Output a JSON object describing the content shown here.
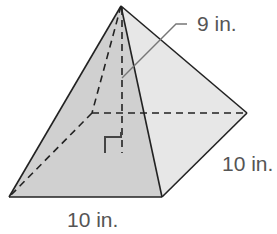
{
  "figure": {
    "type": "square pyramid",
    "labels": {
      "height": "9 in.",
      "base_front_edge": "10 in.",
      "base_side_edge": "10 in."
    },
    "colors": {
      "left_face": "#d9d9d9",
      "front_face": "#cfcfcf",
      "right_face": "#e6e6e6",
      "edge": "#222222",
      "label": "#555555",
      "leader": "#777777"
    }
  }
}
